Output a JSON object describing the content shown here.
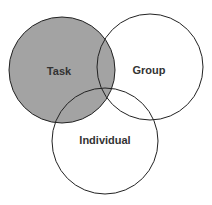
{
  "diagram": {
    "type": "venn",
    "colors": {
      "highlight_fill": "#a3a3a3",
      "stroke": "#222222",
      "background": "#ffffff"
    },
    "circles": [
      {
        "id": "task",
        "label": "Task",
        "highlighted": true
      },
      {
        "id": "group",
        "label": "Group",
        "highlighted": false
      },
      {
        "id": "individual",
        "label": "Individual",
        "highlighted": false
      }
    ]
  }
}
